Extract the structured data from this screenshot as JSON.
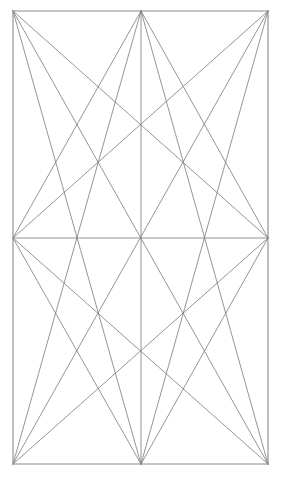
{
  "document": {
    "title": "Geometric Line Diagram",
    "kind": "line-drawing",
    "description": "Rectangle with corner and edge-midpoint vertices joined by straight lines forming a symmetric star lattice"
  },
  "canvas": {
    "width": 285,
    "height": 478,
    "background_color": "#ffffff"
  },
  "style": {
    "line_color": "#7a7a7a",
    "border_color": "#8a8a8a",
    "line_width": 0.8,
    "border_width": 1.1
  },
  "figure": {
    "rect": {
      "left": 13,
      "top": 11,
      "right": 268,
      "bottom": 464,
      "width": 255,
      "height": 453
    },
    "points": {
      "TL": [
        13,
        11
      ],
      "TM": [
        141,
        11
      ],
      "TR": [
        268,
        11
      ],
      "ML": [
        13,
        238
      ],
      "C": [
        141,
        238
      ],
      "MR": [
        268,
        238
      ],
      "BL": [
        13,
        464
      ],
      "BM": [
        141,
        464
      ],
      "BR": [
        268,
        464
      ]
    },
    "point_labels": {
      "TL": "top-left corner",
      "TM": "top-edge midpoint",
      "TR": "top-right corner",
      "ML": "left-edge midpoint",
      "C": "center",
      "MR": "right-edge midpoint",
      "BL": "bottom-left corner",
      "BM": "bottom-edge midpoint",
      "BR": "bottom-right corner"
    },
    "border_edges": [
      [
        "TL",
        "TR"
      ],
      [
        "TR",
        "BR"
      ],
      [
        "BR",
        "BL"
      ],
      [
        "BL",
        "TL"
      ]
    ],
    "axes": [
      [
        "TM",
        "BM"
      ],
      [
        "ML",
        "MR"
      ]
    ],
    "diagonals": [
      [
        "TL",
        "BR"
      ],
      [
        "TR",
        "BL"
      ]
    ],
    "corner_to_midpoint_lines": [
      [
        "TL",
        "MR"
      ],
      [
        "TL",
        "BM"
      ],
      [
        "TR",
        "ML"
      ],
      [
        "TR",
        "BM"
      ],
      [
        "BL",
        "MR"
      ],
      [
        "BL",
        "TM"
      ],
      [
        "BR",
        "ML"
      ],
      [
        "BR",
        "TM"
      ]
    ],
    "midpoint_to_midpoint_lines": [
      [
        "TM",
        "ML"
      ],
      [
        "TM",
        "MR"
      ],
      [
        "BM",
        "ML"
      ],
      [
        "BM",
        "MR"
      ]
    ],
    "counts": {
      "vertices": 9,
      "border_edges": 4,
      "interior_lines": 14,
      "total_segments": 18
    }
  }
}
